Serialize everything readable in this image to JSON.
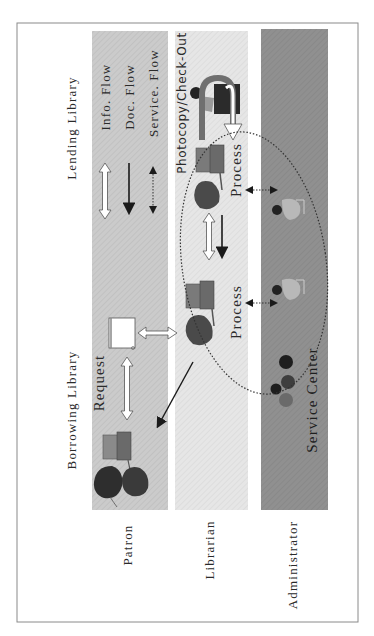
{
  "diagram": {
    "orientation": "rotated-90-ccw",
    "colors": {
      "frame": "#8a8a8a",
      "band_patron": "#c9c9c9",
      "band_librarian": "#e4e4e4",
      "band_administrator": "#8e8e8e",
      "text": "#2a2a2a",
      "arrow_dark": "#1a1a1a",
      "arrow_white_fill": "#ffffff"
    },
    "section_headers": {
      "lending_library": "Lending Library",
      "borrowing_library": "Borrowing Library"
    },
    "lanes": [
      {
        "id": "patron",
        "label": "Patron"
      },
      {
        "id": "librarian",
        "label": "Librarian"
      },
      {
        "id": "administrator",
        "label": "Administrator"
      }
    ],
    "legend": [
      {
        "symbol": "white-double-arrow",
        "label": "Info. Flow"
      },
      {
        "symbol": "black-solid-arrow",
        "label": "Doc. Flow"
      },
      {
        "symbol": "dotted-double-arrow",
        "label": "Service. Flow"
      }
    ],
    "annotations": {
      "photocopy": "Photocopy/Check-Out",
      "process_upper": "Process",
      "process_lower": "Process",
      "request": "Request",
      "service_center": "Service Center"
    },
    "icons": {
      "patron_computer": "computer-icon",
      "patron_people": "people-icon",
      "request_document": "document-scroll-icon",
      "librarian_computer_upper": "computer-icon",
      "librarian_computer_lower": "computer-icon",
      "photocopier_operator": "person-at-photocopier-icon",
      "admin_person_upper": "person-at-desk-icon",
      "admin_person_lower": "person-at-desk-icon",
      "service_center_group": "group-icon"
    }
  }
}
